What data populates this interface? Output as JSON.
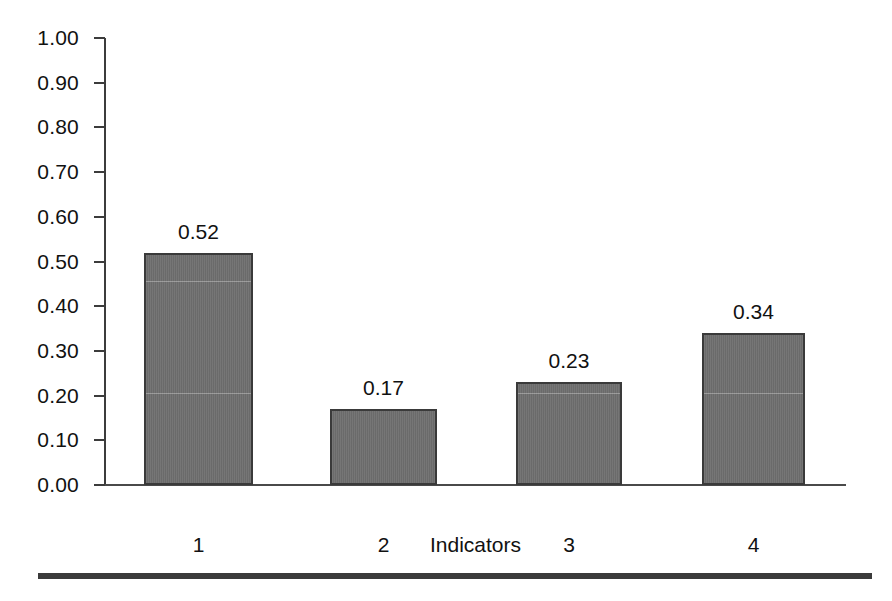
{
  "chart_data": {
    "type": "bar",
    "title": "",
    "subtitle": "",
    "xlabel": "Indicators",
    "ylabel": "",
    "categories": [
      "1",
      "2",
      "3",
      "4"
    ],
    "values": [
      0.52,
      0.17,
      0.23,
      0.34
    ],
    "data_labels": [
      "0.52",
      "0.17",
      "0.23",
      "0.34"
    ],
    "ylim": [
      0.0,
      1.0
    ],
    "ytick_values": [
      0.0,
      0.1,
      0.2,
      0.3,
      0.4,
      0.5,
      0.6,
      0.7,
      0.8,
      0.9,
      1.0
    ],
    "ytick_labels": [
      "0.00",
      "0.10",
      "0.20",
      "0.30",
      "0.40",
      "0.50",
      "0.60",
      "0.70",
      "0.80",
      "0.90",
      "1.00"
    ],
    "grid": false,
    "legend": null,
    "legend_position": "none",
    "series": [
      {
        "name": "",
        "values": [
          0.52,
          0.17,
          0.23,
          0.34
        ]
      }
    ],
    "colors": {
      "bar_fill": "#6e6e6e",
      "bar_border": "#3a3a3a",
      "axis": "#3c3c3c",
      "text": "#111111",
      "background": "#ffffff",
      "bottom_rule": "#3b3b3b"
    }
  },
  "axis": {
    "x_title": "Indicators"
  }
}
